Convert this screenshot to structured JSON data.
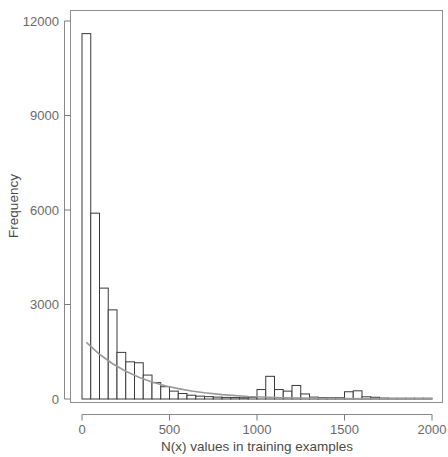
{
  "chart_data": {
    "type": "bar",
    "title": "",
    "subtitle": "",
    "xlabel": "N(x) values in training examples",
    "ylabel": "Frequency",
    "xlim": [
      -60,
      2000
    ],
    "ylim": [
      0,
      12400
    ],
    "xticks": [
      0,
      500,
      1000,
      1500,
      2000
    ],
    "xtick_labels": [
      "0",
      "500",
      "1000",
      "1500",
      "2000"
    ],
    "yticks": [
      0,
      3000,
      6000,
      9000,
      12000
    ],
    "ytick_labels": [
      "0",
      "3000",
      "6000",
      "9000",
      "12000"
    ],
    "grid": false,
    "legend": null,
    "bin_width": 50,
    "categories": [
      "0-50",
      "50-100",
      "100-150",
      "150-200",
      "200-250",
      "250-300",
      "300-350",
      "350-400",
      "400-450",
      "450-500",
      "500-550",
      "550-600",
      "600-650",
      "650-700",
      "700-750",
      "750-800",
      "800-850",
      "850-900",
      "900-950",
      "950-1000",
      "1000-1050",
      "1050-1100",
      "1100-1150",
      "1150-1200",
      "1200-1250",
      "1250-1300",
      "1300-1350",
      "1350-1400",
      "1400-1450",
      "1450-1500",
      "1500-1550",
      "1550-1600",
      "1600-1650",
      "1650-1700",
      "1700-1750",
      "1750-1800",
      "1800-1850",
      "1850-1900",
      "1900-1950",
      "1950-2000"
    ],
    "bin_starts": [
      0,
      50,
      100,
      150,
      200,
      250,
      300,
      350,
      400,
      450,
      500,
      550,
      600,
      650,
      700,
      750,
      800,
      850,
      900,
      950,
      1000,
      1050,
      1100,
      1150,
      1200,
      1250,
      1300,
      1350,
      1400,
      1450,
      1500,
      1550,
      1600,
      1650,
      1700,
      1750,
      1800,
      1850,
      1900,
      1950
    ],
    "values": [
      11600,
      5900,
      3520,
      2830,
      1480,
      1180,
      1150,
      760,
      520,
      390,
      250,
      175,
      120,
      90,
      75,
      60,
      50,
      45,
      40,
      55,
      300,
      720,
      300,
      250,
      430,
      160,
      60,
      45,
      40,
      40,
      230,
      260,
      70,
      55,
      30,
      25,
      20,
      18,
      15,
      12
    ],
    "series": [
      {
        "name": "exponential-fit",
        "type": "line",
        "x": [
          25,
          100,
          175,
          250,
          325,
          400,
          475,
          550,
          625,
          700,
          800,
          950,
          1150,
          1450,
          1750,
          2000
        ],
        "y": [
          1800,
          1420,
          1120,
          880,
          690,
          540,
          420,
          330,
          255,
          200,
          140,
          80,
          40,
          15,
          8,
          5
        ],
        "color": "#9a9a9a"
      }
    ]
  },
  "axis": {
    "ylabel": "Frequency",
    "xlabel": "N(x) values in training examples"
  }
}
